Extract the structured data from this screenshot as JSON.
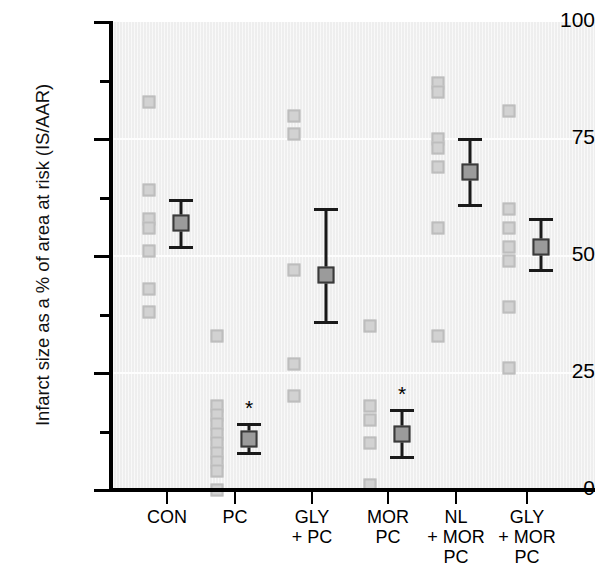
{
  "chart_data": {
    "type": "scatter",
    "title": "",
    "xlabel": "",
    "ylabel": "Infarct size as a % of area at risk (IS/AAR)",
    "ylim": [
      0,
      100
    ],
    "yticks": [
      0,
      25,
      50,
      75,
      100
    ],
    "ytick_labels": [
      "0",
      "25",
      "50",
      "75",
      "100"
    ],
    "y_minor_ticks": [
      12.5,
      37.5,
      62.5,
      87.5
    ],
    "grid": "horizontal faint white gridlines at 25, 50, 75",
    "legend": "none",
    "categories": [
      "CON",
      "PC",
      "GLY\n+ PC",
      "MOR\nPC",
      "NL\n+ MOR\nPC",
      "GLY\n+ MOR\nPC"
    ],
    "groups": [
      {
        "name": "CON",
        "label_lines": [
          "CON"
        ],
        "points": [
          83,
          64,
          58,
          56,
          51,
          43,
          38
        ],
        "mean": 57,
        "err_low": 52,
        "err_high": 62,
        "significant": false
      },
      {
        "name": "PC",
        "label_lines": [
          "PC"
        ],
        "points": [
          33,
          18,
          16,
          14,
          12,
          10,
          8,
          6,
          4,
          0
        ],
        "mean": 11,
        "err_low": 8,
        "err_high": 14,
        "significant": true
      },
      {
        "name": "GLY + PC",
        "label_lines": [
          "GLY",
          "+ PC"
        ],
        "points": [
          80,
          76,
          47,
          27,
          20
        ],
        "mean": 46,
        "err_low": 36,
        "err_high": 60,
        "significant": false
      },
      {
        "name": "MOR PC",
        "label_lines": [
          "MOR",
          "PC"
        ],
        "points": [
          35,
          18,
          15,
          10,
          1
        ],
        "mean": 12,
        "err_low": 7,
        "err_high": 17,
        "significant": true
      },
      {
        "name": "NL + MOR PC",
        "label_lines": [
          "NL",
          "+ MOR",
          "PC"
        ],
        "points": [
          87,
          85,
          75,
          73,
          69,
          56,
          33
        ],
        "mean": 68,
        "err_low": 61,
        "err_high": 75,
        "significant": false
      },
      {
        "name": "GLY + MOR PC",
        "label_lines": [
          "GLY",
          "+ MOR",
          "PC"
        ],
        "points": [
          81,
          60,
          56,
          52,
          49,
          39,
          26
        ],
        "mean": 52,
        "err_low": 47,
        "err_high": 58,
        "significant": false
      }
    ],
    "significance_marker": "*",
    "colors": {
      "point_fill": "#d2d2d2",
      "point_edge": "#bdbdbd",
      "mean_fill": "#9b9b9b",
      "mean_edge": "#3a3a3a",
      "error_bar": "#1a1a1a",
      "plot_background": "#f1f1f1",
      "axis": "#000000",
      "gridline": "#fdfdfd",
      "text": "#000000"
    }
  }
}
